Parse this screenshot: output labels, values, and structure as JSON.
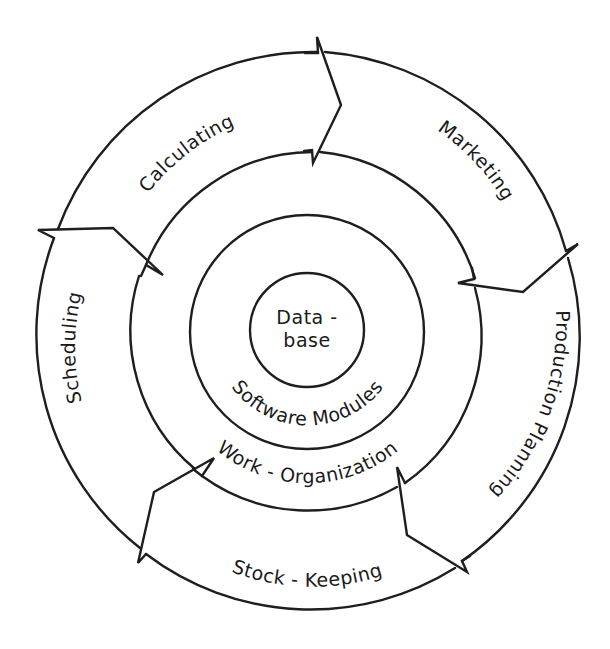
{
  "diagram": {
    "type": "concentric-cycle",
    "center": {
      "label_line1": "Data -",
      "label_line2": "base"
    },
    "inner_ring": {
      "label": "Software Modules"
    },
    "middle_ring": {
      "label": "Work - Organization"
    },
    "outer_cycle": {
      "direction": "clockwise",
      "segments": [
        {
          "id": "calculating",
          "label": "Calculating"
        },
        {
          "id": "marketing",
          "label": "Marketing"
        },
        {
          "id": "production-planning",
          "label": "Production Planning"
        },
        {
          "id": "stock-keeping",
          "label": "Stock - Keeping"
        },
        {
          "id": "scheduling",
          "label": "Scheduling"
        }
      ]
    },
    "colors": {
      "line": "#1e1e1e",
      "background": "#ffffff",
      "text": "#1a1a1a"
    }
  }
}
